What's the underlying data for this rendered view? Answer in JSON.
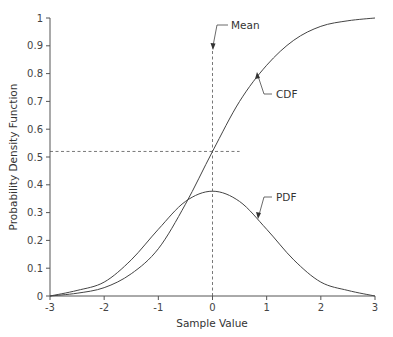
{
  "chart_data": {
    "type": "line",
    "title": "",
    "xlabel": "Sample Value",
    "ylabel": "Probability Density Function",
    "xlim": [
      -3,
      3
    ],
    "ylim": [
      0,
      1
    ],
    "grid": false,
    "legend": "none (inline annotations)",
    "x_ticks": [
      "-3",
      "-2",
      "-1",
      "0",
      "1",
      "2",
      "3"
    ],
    "y_ticks": [
      "0",
      "0.1",
      "0.2",
      "0.3",
      "0.4",
      "0.5",
      "0.6",
      "0.7",
      "0.8",
      "0.9",
      "1"
    ],
    "x": [
      -3,
      -2.5,
      -2,
      -1.5,
      -1,
      -0.5,
      0,
      0.5,
      1,
      1.5,
      2,
      2.5,
      3
    ],
    "series": [
      {
        "name": "CDF",
        "values": [
          0.0,
          0.01,
          0.03,
          0.08,
          0.17,
          0.33,
          0.52,
          0.7,
          0.83,
          0.92,
          0.97,
          0.99,
          1.0
        ]
      },
      {
        "name": "PDF",
        "values": [
          0.0,
          0.02,
          0.05,
          0.13,
          0.24,
          0.34,
          0.377,
          0.34,
          0.24,
          0.13,
          0.05,
          0.02,
          0.0
        ]
      }
    ],
    "annotations": [
      {
        "text": "Mean",
        "points_to": "vertical dashed line at x = 0"
      },
      {
        "text": "CDF",
        "points_to": "CDF curve near x = 0.8"
      },
      {
        "text": "PDF",
        "points_to": "PDF curve near x = 0.8"
      },
      {
        "text": "",
        "type": "horizontal dashed reference line",
        "y": 0.52,
        "x_range": [
          -3,
          0.5
        ]
      },
      {
        "text": "",
        "type": "vertical dashed reference line",
        "x": 0,
        "y_range": [
          0,
          0.9
        ]
      }
    ]
  },
  "labels": {
    "mean": "Mean",
    "cdf": "CDF",
    "pdf": "PDF"
  }
}
